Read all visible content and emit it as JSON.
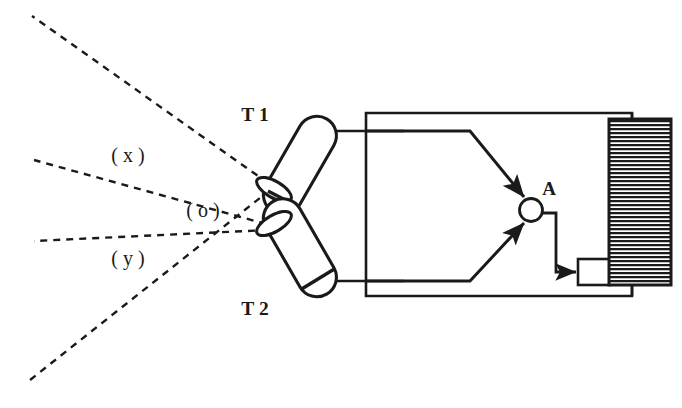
{
  "figure": {
    "background_color": "#ffffff",
    "ink_color": "#1a1a1a",
    "width": 682,
    "height": 408
  },
  "labels": {
    "transducer_1": "T 1",
    "transducer_2": "T 2",
    "region_x": "( x )",
    "region_o": "( o )",
    "region_y": "( y )",
    "node_a": "A"
  },
  "diagram_data": {
    "type": "schematic",
    "components": [
      {
        "name": "transducer-t1",
        "label": "T 1",
        "shape": "rounded-cylinder",
        "orientation_deg": -30,
        "face_side": "lower-left",
        "lead_to": "circuit-top-rail"
      },
      {
        "name": "transducer-t2",
        "label": "T 2",
        "shape": "rounded-cylinder",
        "orientation_deg": 30,
        "face_side": "upper-left",
        "lead_to": "circuit-bottom-rail"
      },
      {
        "name": "summing-node-a",
        "label": "A",
        "shape": "circle",
        "inputs": 2,
        "input_style": "filled-arrowhead",
        "output_to": "small-block"
      },
      {
        "name": "hatched-block",
        "shape": "rectangle",
        "fill": "horizontal-hatch",
        "hatch_pitch_px": 4
      },
      {
        "name": "small-block",
        "shape": "rectangle",
        "fill": "white"
      },
      {
        "name": "outer-loop",
        "shape": "rectangle",
        "style": "solid"
      }
    ],
    "beam_rays": {
      "style": "dashed",
      "dash_pattern": "7 6",
      "count": 4,
      "description": "Two beam cones, one from each transducer, crossing on the left to form labelled regions (x), (o) and (y)."
    },
    "regions": [
      {
        "label": "( x )",
        "position": "upper-left"
      },
      {
        "label": "( o )",
        "position": "center-overlap"
      },
      {
        "label": "( y )",
        "position": "lower-left"
      }
    ]
  }
}
